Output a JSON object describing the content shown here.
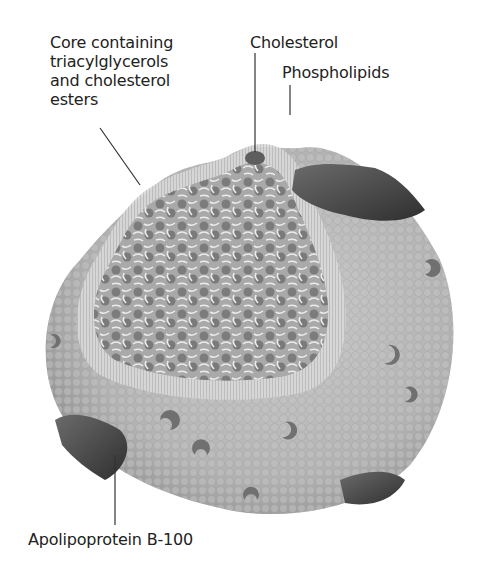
{
  "figure": {
    "background": "#ffffff",
    "colors": {
      "shell_spheres": "#b8b8b8",
      "shell_shadow": "#8e8e8e",
      "core_spheres": "#7a7a7a",
      "lipid_tails": "#e6e6e6",
      "protein": "#4a4a4a",
      "cholesterol": "#5e5e5e",
      "leader_line": "#333333",
      "label_text": "#222222"
    }
  },
  "labels": {
    "core": "Core containing\ntriacylglycerols\nand cholesterol\nesters",
    "cholesterol": "Cholesterol",
    "phospholipids": "Phospholipids",
    "apolipoprotein": "Apolipoprotein B-100"
  }
}
